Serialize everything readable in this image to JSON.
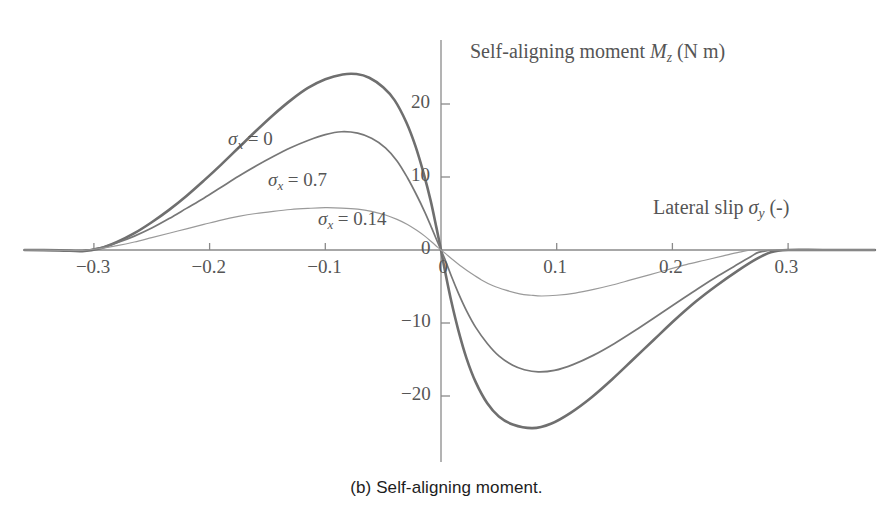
{
  "caption": "(b) Self-aligning moment.",
  "chart_data": {
    "type": "line",
    "title": "",
    "ylabel": "Self-aligning moment M_z (N m)",
    "xlabel": "Lateral slip σ_y (-)",
    "ylabel_parts": {
      "text": "Self-aligning moment",
      "symbol": "M",
      "symbol_sub": "z",
      "unit": "(N m)"
    },
    "xlabel_parts": {
      "text": "Lateral slip",
      "symbol": "σ",
      "symbol_sub": "y",
      "unit": "(-)"
    },
    "xlim": [
      -0.36,
      0.375
    ],
    "ylim": [
      -28.5,
      28.5
    ],
    "xticks": [
      -0.3,
      -0.2,
      -0.1,
      0,
      0.1,
      0.2,
      0.3
    ],
    "xticklabels": [
      "−0.3",
      "−0.2",
      "−0.1",
      "0",
      "0.1",
      "0.2",
      "0.3"
    ],
    "yticks": [
      -20,
      -10,
      0,
      10,
      20
    ],
    "yticklabels": [
      "−20",
      "−10",
      "0",
      "10",
      "20"
    ],
    "grid": false,
    "legend": "inline-annotations",
    "axis_color": "#8a8a8a",
    "series": [
      {
        "name": "σ_x = 0",
        "label_text": "σ",
        "label_sub": "x",
        "label_value": "= 0",
        "color": "#6f6f6f",
        "width": 2.6,
        "peak": {
          "x": -0.073,
          "y": 24.1
        },
        "trough": {
          "x": 0.079,
          "y": -24.4
        },
        "zero_crossings": [
          -0.3,
          0.0,
          0.285
        ],
        "points": [
          [
            -0.36,
            0.0
          ],
          [
            -0.33,
            -0.05
          ],
          [
            -0.31,
            -0.15
          ],
          [
            -0.295,
            0.2
          ],
          [
            -0.28,
            1.1
          ],
          [
            -0.265,
            2.3
          ],
          [
            -0.25,
            3.8
          ],
          [
            -0.235,
            5.5
          ],
          [
            -0.22,
            7.4
          ],
          [
            -0.205,
            9.5
          ],
          [
            -0.19,
            11.7
          ],
          [
            -0.175,
            14.0
          ],
          [
            -0.16,
            16.3
          ],
          [
            -0.145,
            18.5
          ],
          [
            -0.13,
            20.5
          ],
          [
            -0.115,
            22.2
          ],
          [
            -0.1,
            23.4
          ],
          [
            -0.085,
            24.05
          ],
          [
            -0.073,
            24.1
          ],
          [
            -0.062,
            23.6
          ],
          [
            -0.05,
            22.3
          ],
          [
            -0.04,
            20.5
          ],
          [
            -0.03,
            17.5
          ],
          [
            -0.022,
            14.2
          ],
          [
            -0.015,
            10.5
          ],
          [
            -0.009,
            6.8
          ],
          [
            -0.004,
            3.1
          ],
          [
            0.0,
            0.0
          ],
          [
            0.004,
            -3.3
          ],
          [
            0.009,
            -7.1
          ],
          [
            0.015,
            -11.0
          ],
          [
            0.022,
            -14.8
          ],
          [
            0.03,
            -18.1
          ],
          [
            0.04,
            -21.0
          ],
          [
            0.05,
            -22.8
          ],
          [
            0.062,
            -23.9
          ],
          [
            0.079,
            -24.4
          ],
          [
            0.095,
            -23.8
          ],
          [
            0.112,
            -22.3
          ],
          [
            0.13,
            -20.2
          ],
          [
            0.148,
            -17.7
          ],
          [
            0.166,
            -15.0
          ],
          [
            0.184,
            -12.3
          ],
          [
            0.202,
            -9.6
          ],
          [
            0.22,
            -7.1
          ],
          [
            0.238,
            -4.9
          ],
          [
            0.256,
            -2.9
          ],
          [
            0.272,
            -1.3
          ],
          [
            0.285,
            -0.3
          ],
          [
            0.3,
            0.0
          ],
          [
            0.33,
            0.0
          ],
          [
            0.375,
            0.0
          ]
        ]
      },
      {
        "name": "σ_x = 0.7",
        "label_text": "σ",
        "label_sub": "x",
        "label_value": "= 0.7",
        "color": "#777777",
        "width": 1.7,
        "peak": {
          "x": -0.086,
          "y": 16.2
        },
        "trough": {
          "x": 0.084,
          "y": -16.7
        },
        "zero_crossings": [
          -0.3,
          0.0,
          0.275
        ],
        "points": [
          [
            -0.36,
            0.0
          ],
          [
            -0.33,
            -0.05
          ],
          [
            -0.31,
            -0.1
          ],
          [
            -0.295,
            0.3
          ],
          [
            -0.28,
            1.0
          ],
          [
            -0.265,
            1.9
          ],
          [
            -0.25,
            3.0
          ],
          [
            -0.235,
            4.3
          ],
          [
            -0.22,
            5.7
          ],
          [
            -0.205,
            7.1
          ],
          [
            -0.19,
            8.6
          ],
          [
            -0.175,
            10.1
          ],
          [
            -0.16,
            11.5
          ],
          [
            -0.145,
            12.8
          ],
          [
            -0.13,
            14.0
          ],
          [
            -0.115,
            15.0
          ],
          [
            -0.1,
            15.8
          ],
          [
            -0.086,
            16.2
          ],
          [
            -0.072,
            16.0
          ],
          [
            -0.06,
            15.3
          ],
          [
            -0.048,
            14.0
          ],
          [
            -0.038,
            12.2
          ],
          [
            -0.029,
            9.9
          ],
          [
            -0.021,
            7.5
          ],
          [
            -0.014,
            5.2
          ],
          [
            -0.008,
            3.0
          ],
          [
            -0.003,
            1.1
          ],
          [
            0.0,
            0.0
          ],
          [
            0.004,
            -1.5
          ],
          [
            0.009,
            -3.6
          ],
          [
            0.015,
            -5.9
          ],
          [
            0.022,
            -8.3
          ],
          [
            0.03,
            -10.6
          ],
          [
            0.04,
            -12.8
          ],
          [
            0.05,
            -14.5
          ],
          [
            0.062,
            -15.8
          ],
          [
            0.072,
            -16.4
          ],
          [
            0.084,
            -16.7
          ],
          [
            0.098,
            -16.5
          ],
          [
            0.114,
            -15.7
          ],
          [
            0.132,
            -14.4
          ],
          [
            0.15,
            -12.8
          ],
          [
            0.168,
            -11.0
          ],
          [
            0.186,
            -9.1
          ],
          [
            0.204,
            -7.2
          ],
          [
            0.222,
            -5.3
          ],
          [
            0.24,
            -3.5
          ],
          [
            0.256,
            -2.0
          ],
          [
            0.268,
            -0.9
          ],
          [
            0.275,
            -0.3
          ],
          [
            0.29,
            0.0
          ],
          [
            0.33,
            0.0
          ],
          [
            0.375,
            0.0
          ]
        ]
      },
      {
        "name": "σ_x = 0.14",
        "label_text": "σ",
        "label_sub": "x",
        "label_value": "= 0.14",
        "color": "#9a9a9a",
        "width": 1.2,
        "peak": {
          "x": -0.096,
          "y": 5.8
        },
        "trough": {
          "x": 0.087,
          "y": -6.3
        },
        "zero_crossings": [
          -0.295,
          0.0,
          0.26
        ],
        "points": [
          [
            -0.36,
            0.0
          ],
          [
            -0.33,
            -0.05
          ],
          [
            -0.31,
            -0.05
          ],
          [
            -0.295,
            0.2
          ],
          [
            -0.28,
            0.6
          ],
          [
            -0.265,
            1.1
          ],
          [
            -0.25,
            1.7
          ],
          [
            -0.235,
            2.3
          ],
          [
            -0.22,
            2.9
          ],
          [
            -0.205,
            3.5
          ],
          [
            -0.19,
            4.1
          ],
          [
            -0.175,
            4.6
          ],
          [
            -0.16,
            5.0
          ],
          [
            -0.145,
            5.3
          ],
          [
            -0.13,
            5.55
          ],
          [
            -0.115,
            5.7
          ],
          [
            -0.1,
            5.8
          ],
          [
            -0.086,
            5.75
          ],
          [
            -0.072,
            5.6
          ],
          [
            -0.06,
            5.3
          ],
          [
            -0.048,
            4.8
          ],
          [
            -0.038,
            4.2
          ],
          [
            -0.029,
            3.5
          ],
          [
            -0.021,
            2.7
          ],
          [
            -0.014,
            1.9
          ],
          [
            -0.008,
            1.1
          ],
          [
            -0.003,
            0.4
          ],
          [
            0.0,
            0.0
          ],
          [
            0.004,
            -0.5
          ],
          [
            0.01,
            -1.3
          ],
          [
            0.018,
            -2.3
          ],
          [
            0.026,
            -3.2
          ],
          [
            0.035,
            -4.1
          ],
          [
            0.045,
            -4.9
          ],
          [
            0.056,
            -5.5
          ],
          [
            0.068,
            -6.0
          ],
          [
            0.078,
            -6.2
          ],
          [
            0.087,
            -6.3
          ],
          [
            0.1,
            -6.2
          ],
          [
            0.116,
            -5.9
          ],
          [
            0.132,
            -5.4
          ],
          [
            0.148,
            -4.8
          ],
          [
            0.164,
            -4.1
          ],
          [
            0.18,
            -3.4
          ],
          [
            0.196,
            -2.7
          ],
          [
            0.212,
            -2.0
          ],
          [
            0.228,
            -1.4
          ],
          [
            0.244,
            -0.8
          ],
          [
            0.258,
            -0.3
          ],
          [
            0.27,
            0.0
          ],
          [
            0.3,
            0.0
          ],
          [
            0.375,
            0.0
          ]
        ]
      }
    ],
    "annotations": [
      {
        "id": "ann-sigma-0",
        "series": 0,
        "x_px": 228,
        "y_px": 128
      },
      {
        "id": "ann-sigma-07",
        "series": 1,
        "x_px": 268,
        "y_px": 169
      },
      {
        "id": "ann-sigma-014",
        "series": 2,
        "x_px": 318,
        "y_px": 208
      }
    ],
    "geometry": {
      "origin_x_px": 441,
      "origin_y_px": 250,
      "x_scale_px_per_unit": 1157,
      "y_scale_px_per_unit": 7.3,
      "axis_left_px": 25,
      "axis_right_px": 872,
      "axis_top_px": 40,
      "axis_bottom_px": 462
    }
  }
}
